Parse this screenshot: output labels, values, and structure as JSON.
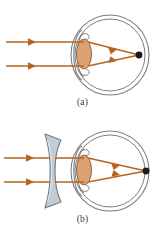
{
  "figure": {
    "background_color": "#ffffff"
  },
  "colors": {
    "ray": "#b5651d",
    "ray_dark": "#8c4a14",
    "eye_outline": "#7c7f86",
    "crystalline_lens_fill": "#d9a373",
    "crystalline_lens_stroke": "#9c6233",
    "corrective_lens_fill": "#c3ccd4",
    "corrective_lens_stroke": "#6e7a85",
    "focal_point": "#1a1a1a",
    "caption_text": "#3a3a3a"
  },
  "panels": [
    {
      "id": "a",
      "caption": "(a)",
      "condition": "uncorrected-myopic-eye",
      "has_corrective_lens": false,
      "focal_point_location": "in-front-of-retina",
      "rays": [
        {
          "name": "upper-incoming-ray",
          "y": 42,
          "x_start": 6,
          "x_end": 80
        },
        {
          "name": "lower-incoming-ray",
          "y": 66,
          "x_start": 6,
          "x_end": 80
        }
      ],
      "refracted_rays": [
        {
          "name": "upper-refracted-ray",
          "from": [
            88,
            42
          ],
          "to": [
            139,
            55
          ]
        },
        {
          "name": "lower-refracted-ray",
          "from": [
            88,
            66
          ],
          "to": [
            139,
            55
          ]
        }
      ],
      "focal_point": {
        "x": 139,
        "y": 55
      },
      "eye": {
        "center_x": 110,
        "center_y": 55,
        "outer_rx": 39,
        "outer_ry": 40,
        "inner_rx": 35,
        "inner_ry": 36
      },
      "crystalline_lens": {
        "cx": 84,
        "cy": 54,
        "rx": 7.5,
        "ry": 15
      }
    },
    {
      "id": "b",
      "caption": "(b)",
      "condition": "corrected-myopic-eye",
      "has_corrective_lens": true,
      "corrective_lens_type": "diverging-concave",
      "focal_point_location": "on-retina",
      "rays": [
        {
          "name": "upper-incoming-ray",
          "y": 42,
          "x_start": 4,
          "x_end": 44
        },
        {
          "name": "lower-incoming-ray",
          "y": 66,
          "x_start": 4,
          "x_end": 44
        }
      ],
      "lens_to_eye_rays": [
        {
          "name": "upper-transmitted-ray",
          "from": [
            60,
            42
          ],
          "to": [
            80,
            42
          ]
        },
        {
          "name": "lower-transmitted-ray",
          "from": [
            60,
            66
          ],
          "to": [
            80,
            66
          ]
        }
      ],
      "refracted_rays": [
        {
          "name": "upper-refracted-ray",
          "from": [
            88,
            42
          ],
          "to": [
            146,
            55
          ]
        },
        {
          "name": "lower-refracted-ray",
          "from": [
            88,
            66
          ],
          "to": [
            146,
            55
          ]
        }
      ],
      "focal_point": {
        "x": 146,
        "y": 55
      },
      "eye": {
        "center_x": 110,
        "center_y": 55,
        "outer_rx": 39,
        "outer_ry": 40,
        "inner_rx": 35,
        "inner_ry": 36
      },
      "crystalline_lens": {
        "cx": 84,
        "cy": 54,
        "rx": 7.5,
        "ry": 15
      },
      "corrective_lens": {
        "x": 44,
        "y": 18,
        "width": 18,
        "height": 74
      }
    }
  ]
}
